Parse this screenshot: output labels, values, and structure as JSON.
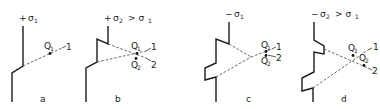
{
  "figure": {
    "panels": [
      {
        "id": "a",
        "caption": "a",
        "header": {
          "sign": "+",
          "sigma": "σ",
          "sub": "1",
          "rest": ""
        },
        "points": [
          {
            "label": "Q",
            "sub": "1",
            "line": "1"
          }
        ]
      },
      {
        "id": "b",
        "caption": "b",
        "header": {
          "sign": "+",
          "sigma": "σ",
          "sub": "2",
          "rest": "> σ",
          "rest_sub": "1"
        },
        "points": [
          {
            "label": "Q",
            "sub": "1",
            "line": "1"
          },
          {
            "label": "Q",
            "sub": "2",
            "line": "2"
          }
        ]
      },
      {
        "id": "c",
        "caption": "c",
        "header": {
          "sign": "−",
          "sigma": "σ",
          "sub": "1",
          "rest": ""
        },
        "points": [
          {
            "label": "Q",
            "sub": "1",
            "line": "1"
          },
          {
            "label": "Q",
            "sub": "2",
            "line": "2"
          }
        ]
      },
      {
        "id": "d",
        "caption": "d",
        "header": {
          "sign": "−",
          "sigma": "σ",
          "sub": "2",
          "rest": "> σ",
          "rest_sub": "1"
        },
        "points": [
          {
            "label": "Q",
            "sub": "1",
            "line": "1"
          },
          {
            "label": "Q",
            "sub": "2",
            "line": "2"
          }
        ]
      }
    ]
  }
}
